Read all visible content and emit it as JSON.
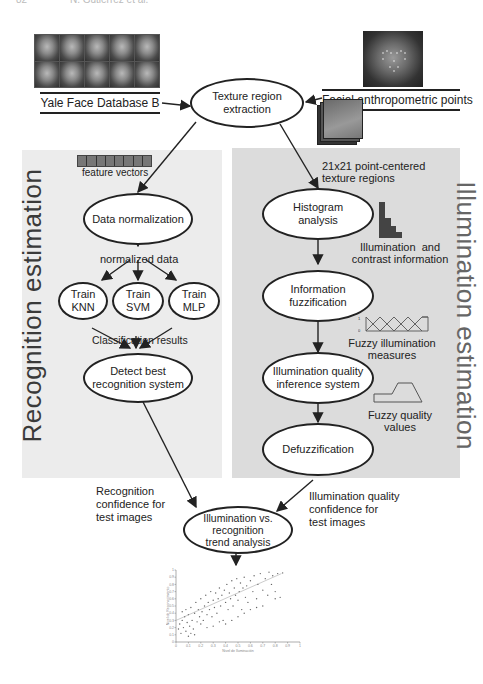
{
  "header": {
    "page_number": "82",
    "running_head": "N. Gutiérrez et al."
  },
  "sources": {
    "database_label": "Yale Face Database B",
    "facial_points_label": "Facial anthropometric points",
    "face_thumbnails": 10
  },
  "nodes": {
    "texture_extraction": "Texture region\nextraction",
    "data_normalization": "Data normalization",
    "train_knn": "Train\nKNN",
    "train_svm": "Train\nSVM",
    "train_mlp": "Train\nMLP",
    "detect_best": "Detect best\nrecognition system",
    "histogram": "Histogram\nanalysis",
    "fuzzification": "Information\nfuzzification",
    "inference": "Illumination quality\ninference system",
    "defuzzification": "Defuzzification",
    "trend_analysis": "Illumination vs.\nrecognition\ntrend analysis"
  },
  "labels": {
    "feature_vectors": "feature vectors",
    "normalized_data": "normalized data",
    "classification_results": "Classification results",
    "texture_regions": "21x21 point-centered\ntexture regions",
    "illumination_contrast": "Illumination  and\ncontrast information",
    "fuzzy_illumination": "Fuzzy illumination\nmeasures",
    "fuzzy_quality": "Fuzzy quality\nvalues",
    "recognition_confidence": "Recognition\nconfidence for\ntest images",
    "illumination_confidence": "Illumination quality\nconfidence for\ntest images",
    "fuzzy_axis_top": "1",
    "fuzzy_axis_bottom": "0"
  },
  "panels": {
    "left_title": "Recognition estimation",
    "right_title": "Illumination estimation"
  },
  "chart_data": {
    "type": "scatter",
    "title": "",
    "xlabel": "Nivel de Iluminación",
    "ylabel": "Nivel de Reconocimiento",
    "xlim": [
      0,
      1
    ],
    "ylim": [
      0,
      1
    ],
    "xticks": [
      "0",
      "0.1",
      "0.2",
      "0.3",
      "0.4",
      "0.5",
      "0.6",
      "0.7",
      "0.8",
      "0.9",
      "1"
    ],
    "yticks": [
      "0",
      "0.1",
      "0.2",
      "0.3",
      "0.4",
      "0.5",
      "0.6",
      "0.7",
      "0.8",
      "0.9",
      "1"
    ],
    "trend_line": {
      "x": [
        0,
        0.85
      ],
      "y": [
        0.3,
        0.95
      ]
    },
    "points": [
      [
        0.02,
        0.18
      ],
      [
        0.03,
        0.25
      ],
      [
        0.04,
        0.12
      ],
      [
        0.05,
        0.3
      ],
      [
        0.05,
        0.42
      ],
      [
        0.06,
        0.2
      ],
      [
        0.07,
        0.35
      ],
      [
        0.08,
        0.15
      ],
      [
        0.08,
        0.45
      ],
      [
        0.09,
        0.27
      ],
      [
        0.1,
        0.38
      ],
      [
        0.11,
        0.22
      ],
      [
        0.12,
        0.48
      ],
      [
        0.13,
        0.3
      ],
      [
        0.14,
        0.18
      ],
      [
        0.15,
        0.4
      ],
      [
        0.16,
        0.55
      ],
      [
        0.17,
        0.28
      ],
      [
        0.18,
        0.45
      ],
      [
        0.19,
        0.35
      ],
      [
        0.2,
        0.6
      ],
      [
        0.21,
        0.42
      ],
      [
        0.22,
        0.3
      ],
      [
        0.23,
        0.5
      ],
      [
        0.24,
        0.65
      ],
      [
        0.25,
        0.38
      ],
      [
        0.26,
        0.55
      ],
      [
        0.27,
        0.45
      ],
      [
        0.28,
        0.7
      ],
      [
        0.29,
        0.35
      ],
      [
        0.3,
        0.58
      ],
      [
        0.31,
        0.48
      ],
      [
        0.32,
        0.68
      ],
      [
        0.33,
        0.4
      ],
      [
        0.34,
        0.6
      ],
      [
        0.35,
        0.75
      ],
      [
        0.36,
        0.5
      ],
      [
        0.37,
        0.65
      ],
      [
        0.38,
        0.3
      ],
      [
        0.39,
        0.72
      ],
      [
        0.4,
        0.55
      ],
      [
        0.41,
        0.8
      ],
      [
        0.42,
        0.45
      ],
      [
        0.43,
        0.68
      ],
      [
        0.44,
        0.6
      ],
      [
        0.45,
        0.85
      ],
      [
        0.46,
        0.5
      ],
      [
        0.47,
        0.75
      ],
      [
        0.48,
        0.65
      ],
      [
        0.49,
        0.88
      ],
      [
        0.5,
        0.58
      ],
      [
        0.51,
        0.7
      ],
      [
        0.52,
        0.82
      ],
      [
        0.53,
        0.45
      ],
      [
        0.54,
        0.75
      ],
      [
        0.55,
        0.9
      ],
      [
        0.56,
        0.62
      ],
      [
        0.57,
        0.78
      ],
      [
        0.58,
        0.55
      ],
      [
        0.6,
        0.85
      ],
      [
        0.62,
        0.7
      ],
      [
        0.63,
        0.92
      ],
      [
        0.65,
        0.6
      ],
      [
        0.66,
        0.8
      ],
      [
        0.68,
        0.95
      ],
      [
        0.7,
        0.72
      ],
      [
        0.72,
        0.88
      ],
      [
        0.74,
        0.65
      ],
      [
        0.75,
        0.97
      ],
      [
        0.77,
        0.8
      ],
      [
        0.78,
        0.92
      ],
      [
        0.8,
        0.7
      ],
      [
        0.82,
        0.95
      ],
      [
        0.84,
        0.62
      ],
      [
        0.86,
        0.96
      ],
      [
        0.2,
        0.25
      ],
      [
        0.25,
        0.2
      ],
      [
        0.3,
        0.22
      ],
      [
        0.35,
        0.28
      ],
      [
        0.15,
        0.1
      ],
      [
        0.45,
        0.3
      ],
      [
        0.5,
        0.35
      ],
      [
        0.55,
        0.4
      ],
      [
        0.6,
        0.45
      ],
      [
        0.4,
        0.25
      ],
      [
        0.1,
        0.08
      ],
      [
        0.12,
        0.12
      ],
      [
        0.7,
        0.5
      ],
      [
        0.65,
        0.48
      ],
      [
        0.8,
        0.6
      ]
    ]
  },
  "colors": {
    "panel_left_bg": "#ececec",
    "panel_right_bg": "#dcdcdc",
    "node_border": "#222222",
    "arrow": "#222222"
  }
}
